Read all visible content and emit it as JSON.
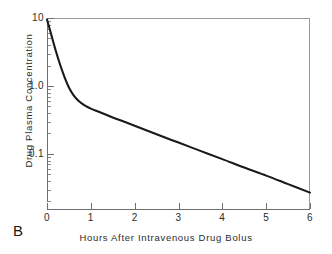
{
  "figure": {
    "panel_label": "B",
    "background_color": "#ffffff",
    "frame_color": "#9a9a9a",
    "axis_color": "#6e6e6e",
    "curve_color": "#1a1a1a"
  },
  "chart_data": {
    "type": "line",
    "title": "",
    "xlabel": "Hours After Intravenous Drug Bolus",
    "ylabel": "Drug Plasma Concentration",
    "yscale": "log",
    "xscale": "linear",
    "xlim": [
      0,
      6
    ],
    "ylim": [
      0.015,
      10
    ],
    "grid": false,
    "legend": null,
    "xticks": [
      0,
      1,
      2,
      3,
      4,
      5,
      6
    ],
    "xticklabels": [
      "0",
      "1",
      "2",
      "3",
      "4",
      "5",
      "6"
    ],
    "yticks": [
      10,
      1.0,
      0.1
    ],
    "yticklabels": [
      "10",
      "1.0",
      "0.1"
    ],
    "yminorticks": [
      9,
      8,
      7,
      6,
      5,
      4,
      3,
      2,
      0.9,
      0.8,
      0.7,
      0.6,
      0.5,
      0.4,
      0.3,
      0.2,
      0.09,
      0.08,
      0.07,
      0.06,
      0.05,
      0.04,
      0.03,
      0.02
    ],
    "series": [
      {
        "name": "Drug plasma concentration",
        "x": [
          0,
          0.1,
          0.2,
          0.3,
          0.4,
          0.5,
          0.6,
          0.7,
          0.8,
          0.9,
          1.0,
          1.25,
          1.5,
          1.75,
          2.0,
          2.5,
          3.0,
          3.5,
          4.0,
          4.5,
          5.0,
          5.5,
          6.0
        ],
        "values": [
          9.5,
          5.6,
          3.3,
          2.05,
          1.35,
          0.95,
          0.74,
          0.62,
          0.55,
          0.5,
          0.465,
          0.4,
          0.345,
          0.3,
          0.26,
          0.195,
          0.147,
          0.111,
          0.084,
          0.063,
          0.048,
          0.036,
          0.027
        ]
      }
    ]
  }
}
